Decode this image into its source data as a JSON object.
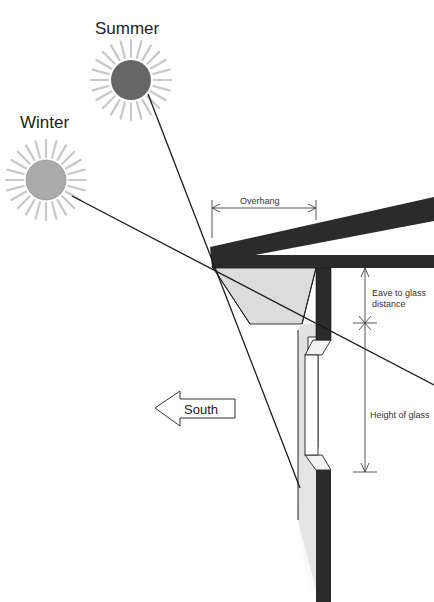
{
  "labels": {
    "summer": "Summer",
    "winter": "Winter",
    "overhang": "Overhang",
    "eave_to_glass_line1": "Eave to glass",
    "eave_to_glass_line2": "distance",
    "height_of_glass": "Height of glass",
    "direction": "South"
  },
  "colors": {
    "summer_sun": "#666666",
    "winter_sun": "#aaaaaa",
    "sun_rays": "#c8c8c8",
    "structure": "#2b2b2b",
    "shade": "#dcdcdc",
    "lines": "#1a1a1a"
  },
  "icons": {
    "summer_sun": "sun-icon",
    "winter_sun": "sun-icon",
    "direction_arrow": "arrow-left-icon"
  }
}
